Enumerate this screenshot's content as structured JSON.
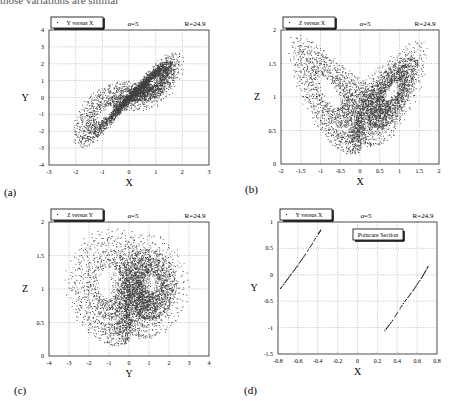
{
  "page": {
    "top_cut_text": "those variations are similar"
  },
  "panels": [
    {
      "id": "a",
      "label": "(a)",
      "legend": "Y versus X",
      "alpha_text": "α=5",
      "r_text": "R=24.9",
      "xlabel": "X",
      "ylabel": "Y",
      "xlim": [
        -3,
        3
      ],
      "ylim": [
        -4,
        4
      ],
      "xticks": [
        "-3",
        "-2",
        "-1",
        "0",
        "1",
        "2",
        "3"
      ],
      "yticks": [
        "-4",
        "-3",
        "-2",
        "-1",
        "0",
        "1",
        "2",
        "3",
        "4"
      ],
      "box": {
        "x0": 49,
        "y0": 30,
        "x1": 209,
        "y1": 165
      },
      "label_pos": {
        "x": 4,
        "y": 186
      },
      "type": "xy"
    },
    {
      "id": "b",
      "label": "(b)",
      "legend": "Z versus X",
      "alpha_text": "α=5",
      "r_text": "R=24.9",
      "xlabel": "X",
      "ylabel": "Z",
      "xlim": [
        -2,
        2
      ],
      "ylim": [
        0,
        2
      ],
      "xticks": [
        "-2",
        "-1.5",
        "-1",
        "-0.5",
        "0",
        "0.5",
        "1",
        "1.5",
        "2"
      ],
      "yticks": [
        "0",
        "0.5",
        "1",
        "1.5",
        "2"
      ],
      "box": {
        "x0": 281,
        "y0": 30,
        "x1": 439,
        "y1": 164
      },
      "label_pos": {
        "x": 245,
        "y": 183
      },
      "type": "xz"
    },
    {
      "id": "c",
      "label": "(c)",
      "legend": "Z versus Y",
      "alpha_text": "α=5",
      "r_text": "R=24.9",
      "xlabel": "Y",
      "ylabel": "Z",
      "xlim": [
        -4,
        4
      ],
      "ylim": [
        0,
        2
      ],
      "xticks": [
        "-4",
        "-3",
        "-2",
        "-1",
        "0",
        "1",
        "2",
        "3",
        "4"
      ],
      "yticks": [
        "0",
        "0.5",
        "1",
        "1.5",
        "2"
      ],
      "box": {
        "x0": 49,
        "y0": 222,
        "x1": 209,
        "y1": 356
      },
      "label_pos": {
        "x": 14,
        "y": 384
      },
      "type": "yz"
    },
    {
      "id": "d",
      "label": "(d)",
      "legend": "Y versus X",
      "alpha_text": "α=5",
      "r_text": "R=24.9",
      "annotation": "Poincare  Section",
      "xlabel": "X",
      "ylabel": "Y",
      "xlim": [
        -0.8,
        0.8
      ],
      "ylim": [
        -1.5,
        1
      ],
      "xticks": [
        "-0.8",
        "-0.6",
        "-0.4",
        "-0.2",
        "0",
        "0.2",
        "0.4",
        "0.6",
        "0.8"
      ],
      "yticks": [
        "-1.5",
        "-1",
        "-0.5",
        "0",
        "0.5",
        "1"
      ],
      "box": {
        "x0": 278,
        "y0": 222,
        "x1": 437,
        "y1": 354
      },
      "label_pos": {
        "x": 244,
        "y": 384
      },
      "type": "poincare"
    }
  ],
  "chart_data": [
    {
      "type": "scatter",
      "title": "Y versus X (α=5, R=24.9)",
      "xlabel": "X",
      "ylabel": "Y",
      "xlim": [
        -3,
        3
      ],
      "ylim": [
        -4,
        4
      ],
      "grid": true,
      "legend_position": "top-left",
      "description": "Two-lobed attractor; lobe centers approx (-1.1,-1.3) and (1.1,1.3), points spanning X∈[-2,2], Y∈[-3,3]",
      "series": [
        {
          "name": "Y versus X",
          "lobe_centers": [
            [
              -1.1,
              -1.3
            ],
            [
              1.1,
              1.3
            ]
          ]
        }
      ]
    },
    {
      "type": "scatter",
      "title": "Z versus X (α=5, R=24.9)",
      "xlabel": "X",
      "ylabel": "Z",
      "xlim": [
        -2,
        2
      ],
      "ylim": [
        0,
        2
      ],
      "grid": true,
      "legend_position": "top-left",
      "description": "Butterfly attractor; lobe centers approx (-1.0,1.1) and (1.0,1.1), cusp near (0,0.25)",
      "series": [
        {
          "name": "Z versus X",
          "lobe_centers": [
            [
              -1.0,
              1.1
            ],
            [
              1.0,
              1.1
            ]
          ]
        }
      ]
    },
    {
      "type": "scatter",
      "title": "Z versus Y (α=5, R=24.9)",
      "xlabel": "Y",
      "ylabel": "Z",
      "xlim": [
        -4,
        4
      ],
      "ylim": [
        0,
        2
      ],
      "grid": true,
      "legend_position": "top-left",
      "description": "Two holes at Y≈-1.2 and Y≈1.2, Z≈1.05; points spanning Y∈[-3,3], Z∈[0.2,1.7]",
      "series": [
        {
          "name": "Z versus Y",
          "hole_centers": [
            [
              -1.2,
              1.05
            ],
            [
              1.2,
              1.05
            ]
          ]
        }
      ]
    },
    {
      "type": "scatter",
      "title": "Poincare Section — Y versus X (α=5, R=24.9)",
      "xlabel": "X",
      "ylabel": "Y",
      "xlim": [
        -0.8,
        0.8
      ],
      "ylim": [
        -1.5,
        1
      ],
      "grid": true,
      "legend_position": "top-left",
      "series": [
        {
          "name": "branch-left",
          "x": [
            -0.78,
            -0.7,
            -0.6,
            -0.5,
            -0.4,
            -0.37
          ],
          "y": [
            -0.25,
            -0.05,
            0.2,
            0.48,
            0.78,
            0.87
          ]
        },
        {
          "name": "branch-right",
          "x": [
            0.27,
            0.35,
            0.45,
            0.55,
            0.65,
            0.71
          ],
          "y": [
            -1.05,
            -0.85,
            -0.55,
            -0.3,
            -0.02,
            0.18
          ]
        }
      ]
    }
  ]
}
